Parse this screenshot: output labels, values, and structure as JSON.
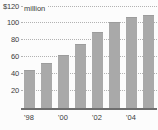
{
  "chart_data": {
    "type": "bar",
    "unit_label": "million",
    "categories": [
      "'98",
      "'99",
      "'00",
      "'01",
      "'02",
      "'03",
      "'04",
      "'05"
    ],
    "values": [
      44,
      52,
      62,
      74,
      89,
      101,
      106,
      109
    ],
    "x_tick_labels": [
      "'98",
      "'00",
      "'02",
      "'04"
    ],
    "x_tick_every": 2,
    "y_ticks": [
      20,
      40,
      60,
      80,
      100,
      120
    ],
    "y_tick_labels": [
      "20",
      "40",
      "60",
      "80",
      "100",
      "$120"
    ],
    "xlabel": "",
    "ylabel": "",
    "ylim": [
      0,
      120
    ],
    "grid": "horizontal-dotted",
    "legend": "none",
    "bar_color": "#a9a9a9",
    "baseline_color": "#6e6e6e",
    "gridline_color": "#b2b2b2",
    "text_color": "#3b3b3b",
    "background_color": "#fcfcfc"
  }
}
